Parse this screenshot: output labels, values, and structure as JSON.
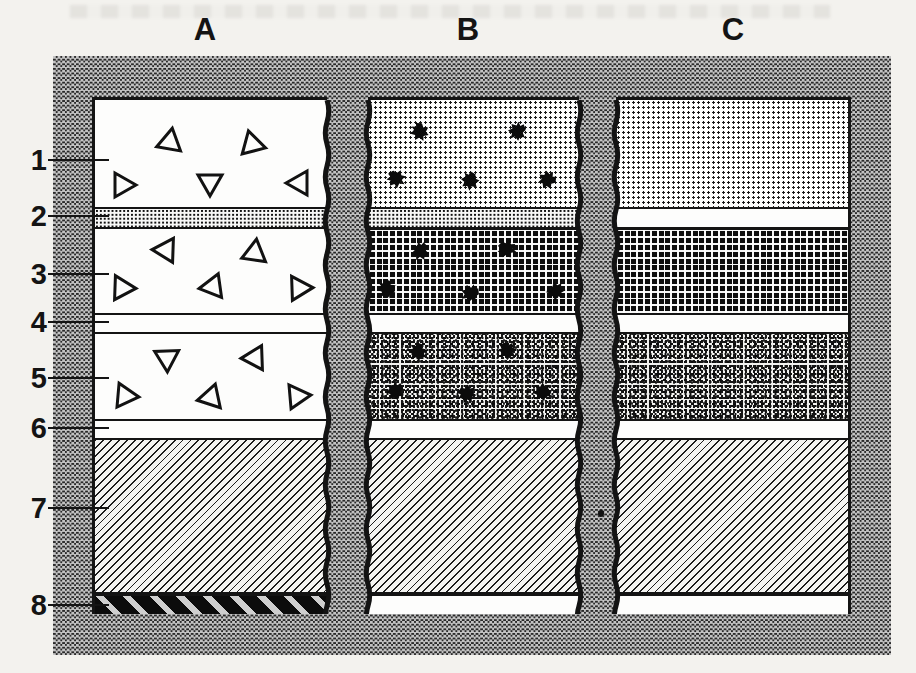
{
  "figure": {
    "column_labels": [
      "A",
      "B",
      "C"
    ],
    "layer_numbers": [
      "1",
      "2",
      "3",
      "4",
      "5",
      "6",
      "7",
      "8"
    ],
    "columns": [
      {
        "id": "A",
        "layers": [
          {
            "num": "1",
            "pattern": "plain",
            "symbols": "triangles"
          },
          {
            "num": "2",
            "pattern": "dense-dots"
          },
          {
            "num": "3",
            "pattern": "plain",
            "symbols": "triangles"
          },
          {
            "num": "4",
            "pattern": "plain"
          },
          {
            "num": "5",
            "pattern": "plain",
            "symbols": "triangles"
          },
          {
            "num": "6",
            "pattern": "plain"
          },
          {
            "num": "7",
            "pattern": "hatch"
          },
          {
            "num": "8",
            "pattern": "black-stripe"
          }
        ]
      },
      {
        "id": "B",
        "layers": [
          {
            "num": "1",
            "pattern": "fine-dots",
            "symbols": "fossils"
          },
          {
            "num": "2",
            "pattern": "dense-dots"
          },
          {
            "num": "3",
            "pattern": "grid",
            "symbols": "fossils"
          },
          {
            "num": "4",
            "pattern": "plain"
          },
          {
            "num": "5",
            "pattern": "speckle",
            "symbols": "fossils"
          },
          {
            "num": "6",
            "pattern": "plain"
          },
          {
            "num": "7",
            "pattern": "hatch"
          },
          {
            "num": "8",
            "pattern": "plain"
          }
        ]
      },
      {
        "id": "C",
        "layers": [
          {
            "num": "1",
            "pattern": "fine-dots"
          },
          {
            "num": "2",
            "pattern": "plain"
          },
          {
            "num": "3",
            "pattern": "grid"
          },
          {
            "num": "4",
            "pattern": "plain"
          },
          {
            "num": "5",
            "pattern": "speckle"
          },
          {
            "num": "6",
            "pattern": "plain"
          },
          {
            "num": "7",
            "pattern": "hatch"
          },
          {
            "num": "8",
            "pattern": "plain"
          }
        ]
      }
    ],
    "geometry": {
      "layer_heights": [
        107,
        20,
        86,
        19,
        87,
        19,
        156,
        20
      ],
      "interior_top": 100,
      "column_boxes": {
        "A": {
          "x": 92,
          "w": 235
        },
        "B": {
          "x": 368,
          "w": 211
        },
        "C": {
          "x": 616,
          "w": 235
        }
      },
      "column_label_x": {
        "A": 205,
        "B": 468,
        "C": 733
      },
      "marker_ys": [
        160,
        216,
        274,
        322,
        378,
        428,
        508,
        605
      ],
      "wavy_edge_centers": [
        327,
        368,
        579,
        616
      ]
    },
    "symbols": {
      "triangles": [
        {
          "x": 72,
          "y": 43,
          "rot": 250
        },
        {
          "x": 160,
          "y": 45,
          "rot": 105
        },
        {
          "x": 30,
          "y": 85,
          "rot": 90
        },
        {
          "x": 115,
          "y": 85,
          "rot": 180
        },
        {
          "x": 202,
          "y": 83,
          "rot": 270
        },
        {
          "x": 68,
          "y": 150,
          "rot": 272
        },
        {
          "x": 160,
          "y": 150,
          "rot": 8
        },
        {
          "x": 30,
          "y": 188,
          "rot": 92
        },
        {
          "x": 115,
          "y": 187,
          "rot": 262
        },
        {
          "x": 207,
          "y": 188,
          "rot": 88
        },
        {
          "x": 72,
          "y": 261,
          "rot": 178
        },
        {
          "x": 157,
          "y": 258,
          "rot": 268
        },
        {
          "x": 33,
          "y": 296,
          "rot": 95
        },
        {
          "x": 113,
          "y": 298,
          "rot": 258
        },
        {
          "x": 205,
          "y": 296,
          "rot": 85
        }
      ],
      "fossils": [
        {
          "x": 52,
          "y": 33,
          "rot": 15
        },
        {
          "x": 149,
          "y": 32,
          "rot": 80
        },
        {
          "x": 29,
          "y": 80,
          "rot": -20
        },
        {
          "x": 102,
          "y": 82,
          "rot": 40
        },
        {
          "x": 179,
          "y": 80,
          "rot": 110
        },
        {
          "x": 52,
          "y": 152,
          "rot": 60
        },
        {
          "x": 140,
          "y": 150,
          "rot": -35
        },
        {
          "x": 19,
          "y": 190,
          "rot": 20
        },
        {
          "x": 102,
          "y": 194,
          "rot": 95
        },
        {
          "x": 189,
          "y": 192,
          "rot": -60
        },
        {
          "x": 50,
          "y": 253,
          "rot": 30
        },
        {
          "x": 140,
          "y": 252,
          "rot": -15
        },
        {
          "x": 27,
          "y": 292,
          "rot": 70
        },
        {
          "x": 100,
          "y": 295,
          "rot": -45
        },
        {
          "x": 174,
          "y": 292,
          "rot": 120
        }
      ]
    },
    "colors": {
      "ink": "#141414",
      "paper": "#f3f2ee",
      "frame_dark": "#2a2a2a",
      "frame_light": "#c3c3c3"
    }
  }
}
